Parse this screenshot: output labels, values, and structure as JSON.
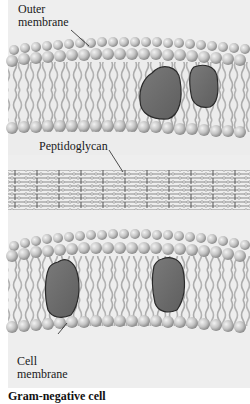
{
  "labels": {
    "outer_membrane_line1": "Outer",
    "outer_membrane_line2": "membrane",
    "peptidoglycan": "Peptidoglycan",
    "cell_membrane_line1": "Cell",
    "cell_membrane_line2": "membrane"
  },
  "caption": "Gram-negative cell",
  "colors": {
    "background": "#eeeeee",
    "phospholipid_head": "#c4c4c4",
    "lipid_tail": "#9a9a9a",
    "protein_fill": "#6f6f6f",
    "protein_outline": "#2a2a2a",
    "peptidoglycan_strand": "#8a8a8a"
  },
  "structure": {
    "layers": [
      "Outer membrane",
      "Peptidoglycan",
      "Cell membrane"
    ],
    "outer_membrane_proteins": 2,
    "cell_membrane_proteins": 2
  }
}
